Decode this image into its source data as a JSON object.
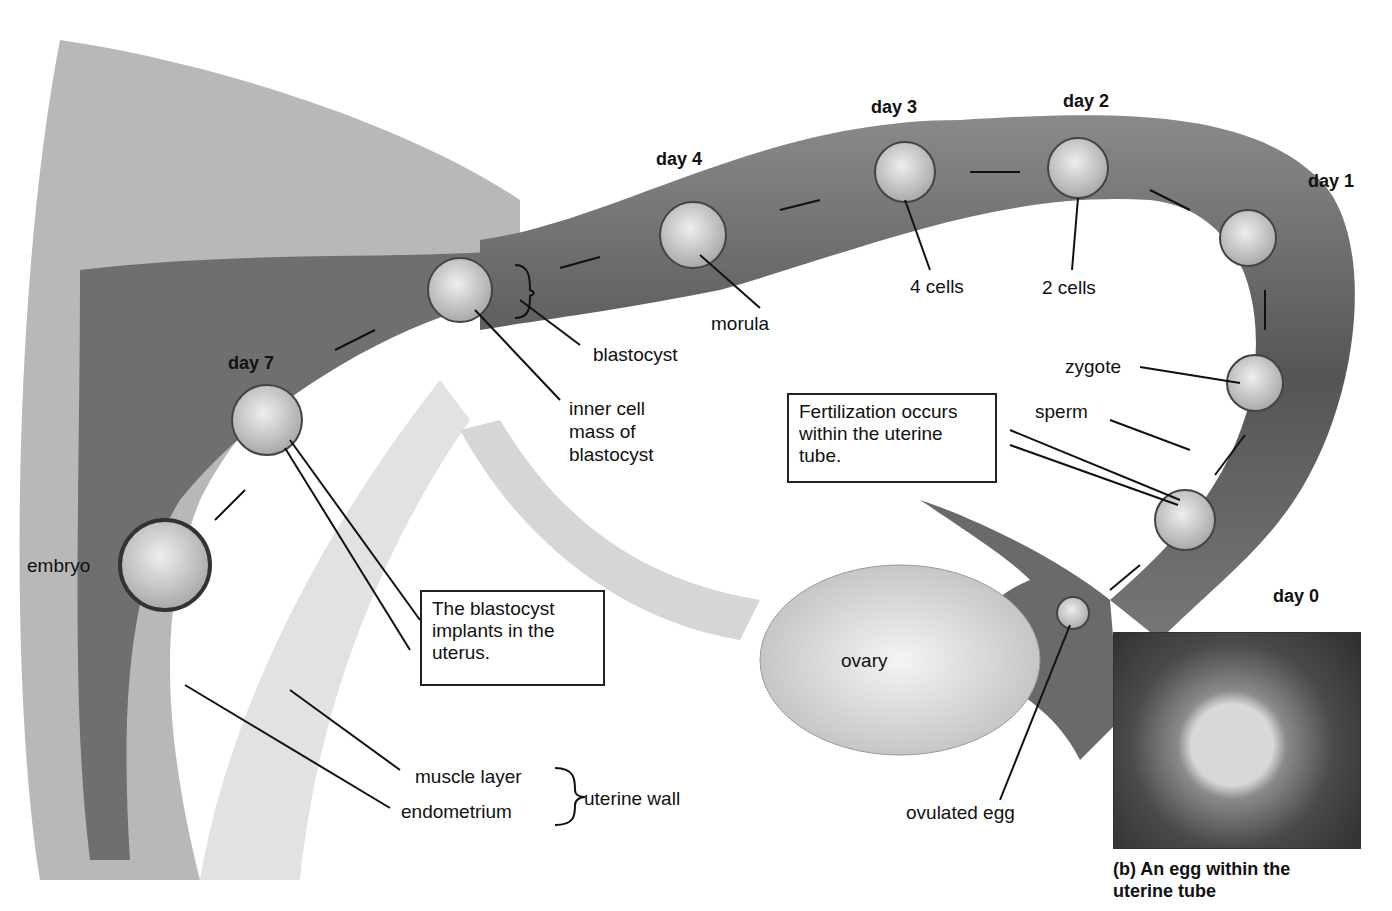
{
  "diagram": {
    "days": {
      "day0": "day 0",
      "day1": "day 1",
      "day2": "day 2",
      "day3": "day 3",
      "day4": "day 4",
      "day7": "day 7"
    },
    "labels": {
      "four_cells": "4 cells",
      "two_cells": "2 cells",
      "morula": "morula",
      "blastocyst": "blastocyst",
      "inner_cell_mass_1": "inner cell",
      "inner_cell_mass_2": "mass of",
      "inner_cell_mass_3": "blastocyst",
      "zygote": "zygote",
      "sperm": "sperm",
      "embryo": "embryo",
      "ovary": "ovary",
      "ovulated_egg": "ovulated egg",
      "muscle_layer": "muscle layer",
      "endometrium": "endometrium",
      "uterine_wall": "uterine wall"
    },
    "callouts": {
      "fertilization": "Fertilization occurs within the uterine tube.",
      "implantation": "The blastocyst implants in the uterus."
    },
    "inset": {
      "caption_line1": "(b) An egg within the",
      "caption_line2": "uterine tube"
    }
  }
}
